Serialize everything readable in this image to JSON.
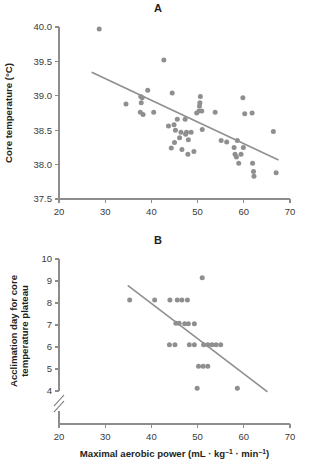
{
  "figure": {
    "panel_a_label": "A",
    "panel_b_label": "B",
    "shared_xlabel_main": "Maximal aerobic power (mL · kg",
    "shared_xlabel_sup1": "–1",
    "shared_xlabel_mid": " · min",
    "shared_xlabel_sup2": "–1",
    "shared_xlabel_end": ")"
  },
  "chart_data": [
    {
      "type": "scatter",
      "panel": "A",
      "title": "A",
      "xlabel": "Maximal aerobic power (mL · kg⁻¹ · min⁻¹)",
      "ylabel": "Core temperature (°C)",
      "xlim": [
        20,
        70
      ],
      "ylim": [
        37.5,
        40.0
      ],
      "xticks": [
        20,
        30,
        40,
        50,
        60,
        70
      ],
      "yticks": [
        37.5,
        38.0,
        38.5,
        39.0,
        39.5,
        40.0
      ],
      "xtick_labels": [
        "20",
        "30",
        "40",
        "50",
        "60",
        "70"
      ],
      "ytick_labels": [
        "37.5",
        "38.0",
        "38.5",
        "39.0",
        "39.5",
        "40.0"
      ],
      "grid": false,
      "legend": false,
      "marker_color": "#8f8f8f",
      "line_color": "#8f8f8f",
      "regression_line": {
        "x": [
          27.2,
          67.4
        ],
        "y": [
          39.34,
          38.07
        ]
      },
      "points": [
        [
          28.7,
          39.97
        ],
        [
          42.7,
          39.52
        ],
        [
          34.5,
          38.88
        ],
        [
          37.7,
          38.99
        ],
        [
          38.0,
          38.97
        ],
        [
          37.8,
          38.9
        ],
        [
          39.2,
          39.08
        ],
        [
          38.2,
          38.73
        ],
        [
          37.6,
          38.76
        ],
        [
          40.5,
          38.76
        ],
        [
          43.7,
          38.56
        ],
        [
          44.3,
          38.24
        ],
        [
          44.9,
          38.58
        ],
        [
          44.5,
          39.04
        ],
        [
          45.6,
          38.66
        ],
        [
          45.2,
          38.5
        ],
        [
          45.0,
          38.32
        ],
        [
          46.4,
          38.47
        ],
        [
          46.1,
          38.39
        ],
        [
          46.6,
          38.22
        ],
        [
          47.3,
          38.66
        ],
        [
          47.6,
          38.47
        ],
        [
          47.4,
          38.44
        ],
        [
          48.0,
          38.36
        ],
        [
          47.9,
          38.15
        ],
        [
          48.6,
          38.47
        ],
        [
          49.2,
          38.19
        ],
        [
          49.8,
          38.75
        ],
        [
          50.3,
          38.78
        ],
        [
          50.6,
          38.99
        ],
        [
          50.5,
          38.9
        ],
        [
          50.4,
          38.85
        ],
        [
          50.9,
          38.78
        ],
        [
          51.0,
          38.51
        ],
        [
          53.8,
          38.76
        ],
        [
          55.1,
          38.35
        ],
        [
          56.3,
          38.33
        ],
        [
          57.9,
          38.25
        ],
        [
          58.1,
          38.15
        ],
        [
          58.4,
          38.11
        ],
        [
          58.6,
          38.35
        ],
        [
          58.9,
          38.02
        ],
        [
          59.4,
          38.15
        ],
        [
          59.8,
          38.97
        ],
        [
          59.9,
          38.25
        ],
        [
          60.2,
          38.74
        ],
        [
          61.8,
          38.75
        ],
        [
          61.9,
          38.02
        ],
        [
          62.1,
          37.9
        ],
        [
          62.2,
          37.83
        ],
        [
          66.4,
          38.48
        ],
        [
          67.0,
          37.88
        ]
      ]
    },
    {
      "type": "scatter",
      "panel": "B",
      "title": "B",
      "xlabel": "Maximal aerobic power (mL · kg⁻¹ · min⁻¹)",
      "ylabel": "Acclimation day for core temperature plateau",
      "ylabel_line1": "Acclimation day for core",
      "ylabel_line2": "temperature plateau",
      "xlim": [
        20,
        70
      ],
      "ylim": [
        4,
        10
      ],
      "xticks": [
        20,
        30,
        40,
        50,
        60,
        70
      ],
      "yticks": [
        4,
        5,
        6,
        7,
        8,
        9,
        10
      ],
      "xtick_labels": [
        "20",
        "30",
        "40",
        "50",
        "60",
        "70"
      ],
      "ytick_labels": [
        "4",
        "5",
        "6",
        "7",
        "8",
        "9",
        "10"
      ],
      "y_axis_break": true,
      "grid": false,
      "legend": false,
      "marker_color": "#8f8f8f",
      "line_color": "#8f8f8f",
      "regression_line": {
        "x": [
          35.0,
          65.0
        ],
        "y": [
          8.78,
          3.98
        ]
      },
      "points": [
        [
          35.3,
          8.14
        ],
        [
          40.7,
          8.14
        ],
        [
          44.0,
          8.14
        ],
        [
          45.6,
          8.14
        ],
        [
          46.6,
          8.14
        ],
        [
          47.8,
          8.14
        ],
        [
          51.0,
          9.15
        ],
        [
          45.3,
          7.08
        ],
        [
          46.0,
          7.08
        ],
        [
          47.2,
          7.06
        ],
        [
          48.0,
          7.06
        ],
        [
          49.3,
          7.06
        ],
        [
          43.9,
          6.1
        ],
        [
          45.1,
          6.1
        ],
        [
          48.2,
          6.1
        ],
        [
          49.3,
          6.1
        ],
        [
          51.3,
          6.1
        ],
        [
          52.2,
          6.1
        ],
        [
          53.1,
          6.1
        ],
        [
          54.0,
          6.1
        ],
        [
          55.0,
          6.1
        ],
        [
          50.2,
          5.12
        ],
        [
          51.2,
          5.12
        ],
        [
          52.2,
          5.12
        ],
        [
          49.9,
          4.12
        ],
        [
          58.6,
          4.12
        ]
      ]
    }
  ]
}
